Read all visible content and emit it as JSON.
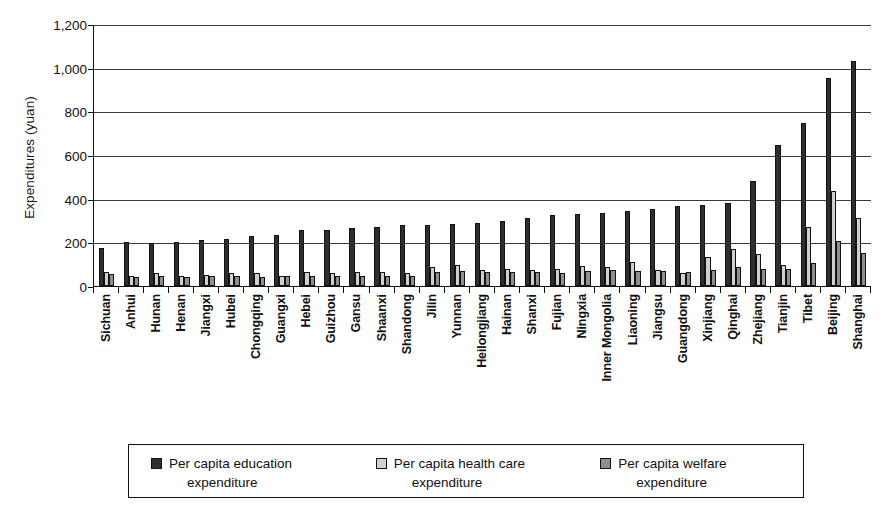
{
  "chart_data": {
    "type": "bar",
    "title": "",
    "xlabel": "",
    "ylabel": "Expenditures (yuan)",
    "ylim": [
      0,
      1200
    ],
    "yticks": [
      0,
      200,
      400,
      600,
      800,
      1000,
      1200
    ],
    "ytick_labels": [
      "0",
      "200",
      "400",
      "600",
      "800",
      "1,000",
      "1,200"
    ],
    "grid": true,
    "legend_position": "bottom",
    "categories": [
      "Sichuan",
      "Anhui",
      "Hunan",
      "Henan",
      "Jiangxi",
      "Hubei",
      "Chongqing",
      "Guangxi",
      "Hebei",
      "Guizhou",
      "Gansu",
      "Shaanxi",
      "Shandong",
      "Jilin",
      "Yunnan",
      "Heilongjiang",
      "Hainan",
      "Shanxi",
      "Fujian",
      "Ningxia",
      "Inner Mongolia",
      "Liaoning",
      "Jiangsu",
      "Guangdong",
      "Xinjiang",
      "Qinghai",
      "Zhejiang",
      "Tianjin",
      "Tibet",
      "Beijing",
      "Shanghai"
    ],
    "series": [
      {
        "name": "Per capita education expenditure",
        "color": "#2e2e2e",
        "values": [
          175,
          200,
          198,
          200,
          210,
          215,
          228,
          235,
          255,
          258,
          265,
          272,
          278,
          278,
          285,
          288,
          300,
          312,
          325,
          332,
          335,
          345,
          352,
          365,
          372,
          382,
          482,
          648,
          745,
          955,
          1030
        ]
      },
      {
        "name": "Per capita health care expenditure",
        "color": "#cfcfcf",
        "values": [
          65,
          45,
          58,
          45,
          52,
          58,
          58,
          48,
          62,
          60,
          65,
          62,
          58,
          88,
          95,
          72,
          78,
          72,
          78,
          92,
          88,
          110,
          72,
          60,
          132,
          168,
          148,
          98,
          272,
          435,
          310
        ]
      },
      {
        "name": "Per capita welfare expenditure",
        "color": "#8f8f8f",
        "values": [
          55,
          40,
          45,
          42,
          48,
          48,
          42,
          45,
          48,
          45,
          48,
          45,
          48,
          62,
          70,
          62,
          65,
          62,
          58,
          68,
          72,
          70,
          68,
          62,
          72,
          85,
          78,
          80,
          105,
          205,
          150
        ]
      }
    ]
  },
  "legend": {
    "items": [
      {
        "line1": "Per capita education",
        "line2": "expenditure",
        "swatch": "series-0-swatch"
      },
      {
        "line1": "Per capita health care",
        "line2": "expenditure",
        "swatch": "series-1-swatch"
      },
      {
        "line1": "Per capita welfare",
        "line2": "expenditure",
        "swatch": "series-2-swatch"
      }
    ]
  }
}
